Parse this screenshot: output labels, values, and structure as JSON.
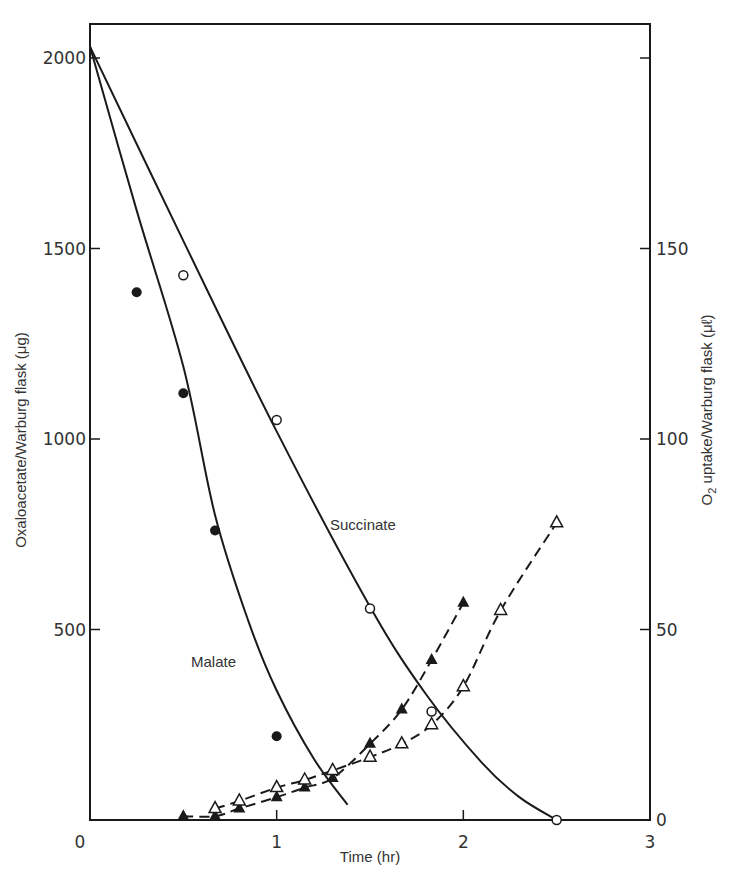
{
  "chart_data": {
    "type": "line",
    "title": "",
    "xlabel": "Time (hr)",
    "ylabel": "Oxaloacetate/Warburg flask (μg)",
    "y2label": "O₂ uptake/Warburg flask (μℓ)",
    "xlim": [
      0,
      3
    ],
    "ylim": [
      0,
      2080
    ],
    "y2lim": [
      0,
      208
    ],
    "x_ticks": [
      0,
      1,
      2,
      3
    ],
    "y_ticks": [
      500,
      1000,
      1500,
      2000
    ],
    "y2_ticks": [
      0,
      50,
      100,
      150
    ],
    "grid": false,
    "annotations": [
      {
        "text": "Succinate",
        "x": 1.65,
        "y": 775
      },
      {
        "text": "Malate",
        "x": 0.58,
        "y": 485
      }
    ],
    "series": [
      {
        "name": "Malate (oxaloacetate)",
        "axis": "left",
        "marker": "filled-circle",
        "line": "solid",
        "points": [
          [
            0.25,
            1385
          ],
          [
            0.5,
            1120
          ],
          [
            0.67,
            760
          ],
          [
            1.0,
            220
          ]
        ],
        "fit_curve": [
          [
            0,
            2030
          ],
          [
            0.25,
            1600
          ],
          [
            0.5,
            1190
          ],
          [
            0.67,
            800
          ],
          [
            0.85,
            520
          ],
          [
            1.0,
            340
          ],
          [
            1.2,
            160
          ],
          [
            1.38,
            40
          ]
        ]
      },
      {
        "name": "Succinate (oxaloacetate)",
        "axis": "left",
        "marker": "open-circle",
        "line": "solid",
        "points": [
          [
            0.5,
            1430
          ],
          [
            1.0,
            1050
          ],
          [
            1.5,
            555
          ],
          [
            1.83,
            285
          ],
          [
            2.5,
            0
          ]
        ],
        "fit_curve": [
          [
            0,
            2030
          ],
          [
            0.5,
            1520
          ],
          [
            1.0,
            1020
          ],
          [
            1.5,
            560
          ],
          [
            1.8,
            330
          ],
          [
            2.1,
            150
          ],
          [
            2.3,
            60
          ],
          [
            2.5,
            0
          ]
        ]
      },
      {
        "name": "O2 uptake (filled triangles)",
        "axis": "right",
        "marker": "filled-triangle",
        "line": "dashed",
        "points": [
          [
            0.5,
            1
          ],
          [
            0.67,
            1
          ],
          [
            0.8,
            3
          ],
          [
            1.0,
            6
          ],
          [
            1.15,
            8.5
          ],
          [
            1.3,
            11
          ],
          [
            1.5,
            20
          ],
          [
            1.67,
            29
          ],
          [
            1.83,
            42
          ],
          [
            2.0,
            57
          ]
        ]
      },
      {
        "name": "O2 uptake (open triangles)",
        "axis": "right",
        "marker": "open-triangle",
        "line": "dashed",
        "points": [
          [
            0.67,
            3
          ],
          [
            0.8,
            5
          ],
          [
            1.0,
            8.5
          ],
          [
            1.15,
            10.5
          ],
          [
            1.3,
            13
          ],
          [
            1.5,
            16.5
          ],
          [
            1.67,
            20
          ],
          [
            1.83,
            25
          ],
          [
            2.0,
            35
          ],
          [
            2.2,
            55
          ],
          [
            2.5,
            78
          ]
        ]
      }
    ]
  },
  "colors": {
    "ink": "#1a1a1a",
    "text": "#333333",
    "background": "#ffffff"
  },
  "labels": {
    "x_title": "Time (hr)",
    "y_title": "Oxaloacetate/Warburg flask (μg)",
    "y2_title_main": "O",
    "y2_title_sub": "2",
    "y2_title_rest": " uptake/Warburg flask (μℓ)",
    "succinate": "Succinate",
    "malate": "Malate"
  }
}
